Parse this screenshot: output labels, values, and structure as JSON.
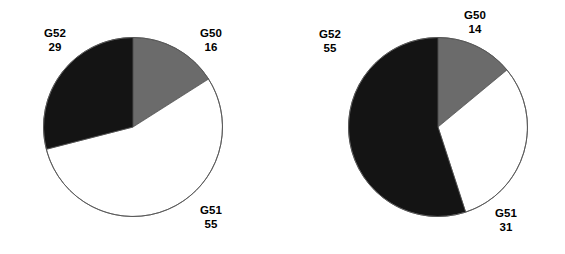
{
  "figure": {
    "background": "#ffffff",
    "colors": {
      "gray": "#6b6b6b",
      "white": "#ffffff",
      "black": "#141414",
      "outline": "#555555"
    }
  },
  "chart_data": [
    {
      "type": "pie",
      "title": "",
      "categories": [
        "G50",
        "G51",
        "G52"
      ],
      "values": [
        16,
        55,
        29
      ],
      "labels": [
        {
          "name": "G50",
          "value": "16",
          "color": "#6b6b6b"
        },
        {
          "name": "G51",
          "value": "55",
          "color": "#ffffff"
        },
        {
          "name": "G52",
          "value": "29",
          "color": "#141414"
        }
      ],
      "start_angle": 90,
      "direction": "clockwise",
      "legend": "none",
      "grid": false
    },
    {
      "type": "pie",
      "title": "",
      "categories": [
        "G50",
        "G51",
        "G52"
      ],
      "values": [
        14,
        31,
        55
      ],
      "labels": [
        {
          "name": "G50",
          "value": "14",
          "color": "#6b6b6b"
        },
        {
          "name": "G51",
          "value": "31",
          "color": "#ffffff"
        },
        {
          "name": "G52",
          "value": "55",
          "color": "#141414"
        }
      ],
      "start_angle": 90,
      "direction": "clockwise",
      "legend": "none",
      "grid": false
    }
  ]
}
